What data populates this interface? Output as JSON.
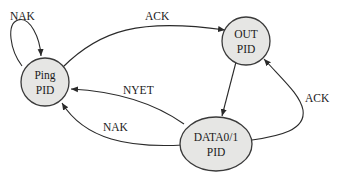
{
  "diagram": {
    "type": "state-machine",
    "nodes": [
      {
        "id": "ping",
        "line1": "Ping",
        "line2": "PID"
      },
      {
        "id": "out",
        "line1": "OUT",
        "line2": "PID"
      },
      {
        "id": "data",
        "line1": "DATA0/1",
        "line2": "PID"
      }
    ],
    "edges": [
      {
        "from": "ping",
        "to": "ping",
        "label": "NAK"
      },
      {
        "from": "ping",
        "to": "out",
        "label": "ACK"
      },
      {
        "from": "out",
        "to": "data",
        "label": ""
      },
      {
        "from": "data",
        "to": "out",
        "label": "ACK"
      },
      {
        "from": "data",
        "to": "ping",
        "label": "NYET"
      },
      {
        "from": "data",
        "to": "ping",
        "label": "NAK"
      }
    ],
    "colors": {
      "node_fill": "#e6e6e4",
      "stroke": "#2a2a2a"
    }
  }
}
